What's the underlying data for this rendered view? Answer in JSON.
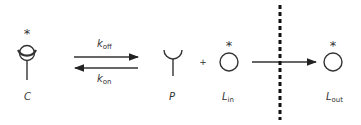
{
  "diagram": {
    "species": {
      "complex": {
        "label": "C",
        "marker": "*"
      },
      "protein": {
        "label": "P"
      },
      "ligand_in": {
        "label": "L",
        "sub": "in",
        "marker": "*"
      },
      "ligand_out": {
        "label": "L",
        "sub": "out",
        "marker": "*"
      }
    },
    "rates": {
      "forward": {
        "label": "k",
        "sub": "off"
      },
      "reverse": {
        "label": "k",
        "sub": "on"
      }
    },
    "operator_plus": "+",
    "membrane": "dashed-barrier"
  }
}
